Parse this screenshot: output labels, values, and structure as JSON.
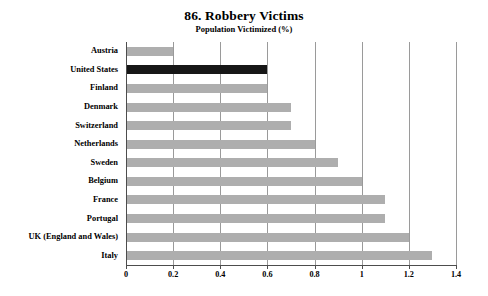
{
  "chart_data": {
    "type": "bar",
    "orientation": "horizontal",
    "title": "86. Robbery Victims",
    "subtitle": "Population Victimized (%)",
    "xlabel": "",
    "ylabel": "",
    "xlim": [
      0,
      1.4
    ],
    "xticks": [
      "0",
      "0.2",
      "0.4",
      "0.6",
      "0.8",
      "1",
      "1.2",
      "1.4"
    ],
    "xtick_values": [
      0,
      0.2,
      0.4,
      0.6,
      0.8,
      1,
      1.2,
      1.4
    ],
    "grid": "vertical",
    "legend": "none",
    "categories": [
      "Austria",
      "United States",
      "Finland",
      "Denmark",
      "Switzerland",
      "Netherlands",
      "Sweden",
      "Belgium",
      "France",
      "Portugal",
      "UK (England and Wales)",
      "Italy"
    ],
    "values": [
      0.2,
      0.6,
      0.6,
      0.7,
      0.7,
      0.8,
      0.9,
      1.0,
      1.1,
      1.1,
      1.2,
      1.3
    ],
    "highlight_category": "United States",
    "bar_color": "#aeaeae",
    "highlight_color": "#171717",
    "gridline_color": "#9a9a9a",
    "axis_color": "#4d4d4d",
    "background_color": "#ffffff"
  }
}
